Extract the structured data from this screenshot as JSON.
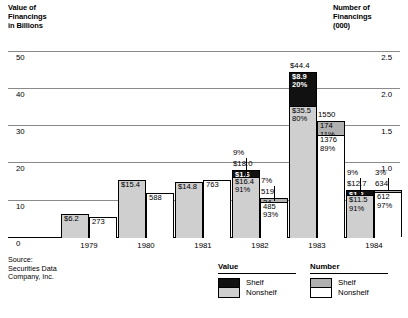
{
  "left_axis": {
    "title": "Value of\nFinancings\nin Billions",
    "ticks": [
      "50",
      "40",
      "30",
      "20",
      "10",
      "0"
    ]
  },
  "right_axis": {
    "title": "Number of\nFinancings\n(000)",
    "ticks": [
      "2.5",
      "2.0",
      "1.5",
      "1.0",
      "0.5"
    ]
  },
  "source": "Source:\nSecurities Data\nCompany, Inc.",
  "legend": {
    "value": {
      "header": "Value",
      "shelf": "Shelf",
      "nonshelf": "Nonshelf"
    },
    "number": {
      "header": "Number",
      "shelf": "Shelf",
      "nonshelf": "Nonshelf"
    }
  },
  "years": [
    "1979",
    "1980",
    "1981",
    "1982",
    "1983",
    "1984"
  ],
  "chart_data": {
    "type": "bar",
    "title": "",
    "categories": [
      "1979",
      "1980",
      "1981",
      "1982",
      "1983",
      "1984"
    ],
    "xlabel": "",
    "ylabel": "Value of Financings in Billions",
    "y2label": "Number of Financings (000)",
    "ylim": [
      0,
      55
    ],
    "y2lim": [
      0,
      2.75
    ],
    "ytick_values": [
      0,
      10,
      20,
      30,
      40,
      50
    ],
    "y2tick_values": [
      0.5,
      1.0,
      1.5,
      2.0,
      2.5
    ],
    "grid": true,
    "legend_position": "bottom",
    "series": [
      {
        "name": "Value Shelf",
        "axis": "left",
        "color": "#111111",
        "values": [
          null,
          null,
          null,
          1.6,
          8.9,
          1.2
        ],
        "percents": [
          null,
          null,
          null,
          "9%",
          "20%",
          "9%"
        ]
      },
      {
        "name": "Value Nonshelf",
        "axis": "left",
        "color": "#cfcfcf",
        "values": [
          6.2,
          15.4,
          14.8,
          16.4,
          35.5,
          11.5
        ],
        "percents": [
          null,
          null,
          null,
          "91%",
          "80%",
          "91%"
        ]
      },
      {
        "name": "Number Shelf",
        "axis": "right",
        "color": "#b0b0b0",
        "values": [
          null,
          null,
          null,
          34,
          174,
          22
        ],
        "percents": [
          null,
          null,
          null,
          "7%",
          "11%",
          "3%"
        ]
      },
      {
        "name": "Number Nonshelf",
        "axis": "right",
        "color": "#ffffff",
        "values": [
          273,
          588,
          763,
          485,
          1376,
          612
        ],
        "percents": [
          null,
          null,
          null,
          "93%",
          "89%",
          "97%"
        ]
      }
    ],
    "value_totals": [
      "$6.2",
      "$15.4",
      "$14.8",
      "$18.0",
      "$44.4",
      "$12.7"
    ],
    "number_totals": [
      "273",
      "588",
      "763",
      "519",
      "1550",
      "634"
    ]
  },
  "bars": {
    "1979": {
      "value": {
        "total_label": "$6.2",
        "total": 6.2,
        "segments": [
          {
            "label": "$6.2",
            "value": 6.2,
            "kind": "solid-value",
            "inside": true
          }
        ]
      },
      "number": {
        "total_label": "273",
        "total": 273,
        "segments": [
          {
            "label": "273",
            "value": 273,
            "kind": "solid-number",
            "inside": true
          }
        ]
      }
    },
    "1980": {
      "value": {
        "total_label": "$15.4",
        "total": 15.4,
        "segments": [
          {
            "label": "$15.4",
            "value": 15.4,
            "kind": "solid-value",
            "inside": true
          }
        ]
      },
      "number": {
        "total_label": "588",
        "total": 588,
        "segments": [
          {
            "label": "588",
            "value": 588,
            "kind": "solid-number",
            "inside": true
          }
        ]
      }
    },
    "1981": {
      "value": {
        "total_label": "$14.8",
        "total": 14.8,
        "segments": [
          {
            "label": "$14.8",
            "value": 14.8,
            "kind": "solid-value",
            "inside": true
          }
        ]
      },
      "number": {
        "total_label": "763",
        "total": 763,
        "segments": [
          {
            "label": "763",
            "value": 763,
            "kind": "solid-number",
            "inside": true
          }
        ]
      }
    },
    "1982": {
      "value": {
        "total_label": "$18.0",
        "total": 18.0,
        "callout": "9%",
        "segments": [
          {
            "label": "$1.6",
            "pct": "",
            "value": 1.6,
            "kind": "shelf-value"
          },
          {
            "label": "$16.4",
            "pct": "91%",
            "value": 16.4,
            "kind": "nonshelf-value"
          }
        ]
      },
      "number": {
        "total_label": "519",
        "total": 519,
        "callout": "7%",
        "segments": [
          {
            "label": "34",
            "pct": "",
            "value": 34,
            "kind": "shelf-number"
          },
          {
            "label": "485",
            "pct": "93%",
            "value": 485,
            "kind": "nonshelf-number"
          }
        ]
      }
    },
    "1983": {
      "value": {
        "total_label": "$44.4",
        "total": 44.4,
        "segments": [
          {
            "label": "$8.9",
            "pct": "20%",
            "value": 8.9,
            "kind": "shelf-value"
          },
          {
            "label": "$35.5",
            "pct": "80%",
            "value": 35.5,
            "kind": "nonshelf-value"
          }
        ]
      },
      "number": {
        "total_label": "1550",
        "total": 1550,
        "segments": [
          {
            "label": "174",
            "pct": "11%",
            "value": 174,
            "kind": "shelf-number"
          },
          {
            "label": "1376",
            "pct": "89%",
            "value": 1376,
            "kind": "nonshelf-number"
          }
        ]
      }
    },
    "1984": {
      "value": {
        "total_label": "$12.7",
        "total": 12.7,
        "callout": "9%",
        "segments": [
          {
            "label": "$1.2",
            "pct": "",
            "value": 1.2,
            "kind": "shelf-value"
          },
          {
            "label": "$11.5",
            "pct": "91%",
            "value": 11.5,
            "kind": "nonshelf-value"
          }
        ]
      },
      "number": {
        "total_label": "634",
        "total": 634,
        "callout": "3%",
        "segments": [
          {
            "label": "22",
            "pct": "",
            "value": 22,
            "kind": "shelf-number"
          },
          {
            "label": "612",
            "pct": "97%",
            "value": 612,
            "kind": "nonshelf-number"
          }
        ]
      }
    }
  }
}
